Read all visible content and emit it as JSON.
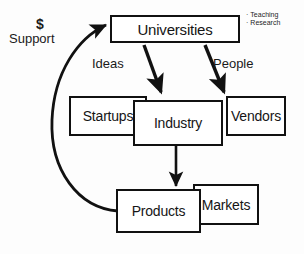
{
  "diagram": {
    "nodes": [
      {
        "id": "universities",
        "label": "Universities"
      },
      {
        "id": "startups",
        "label": "Startups"
      },
      {
        "id": "industry",
        "label": "Industry"
      },
      {
        "id": "vendors",
        "label": "Vendors"
      },
      {
        "id": "products",
        "label": "Products"
      },
      {
        "id": "markets",
        "label": "Markets"
      }
    ],
    "edge_labels": {
      "ideas": "Ideas",
      "people": "People",
      "money": "$",
      "support": "Support"
    },
    "annotations": [
      {
        "bullet": "·",
        "text": "Teaching"
      },
      {
        "bullet": "·",
        "text": "Research"
      }
    ],
    "colors": {
      "stroke": "#111111",
      "fill": "#ffffff",
      "background": "#fdfdfd",
      "text": "#151515"
    }
  }
}
